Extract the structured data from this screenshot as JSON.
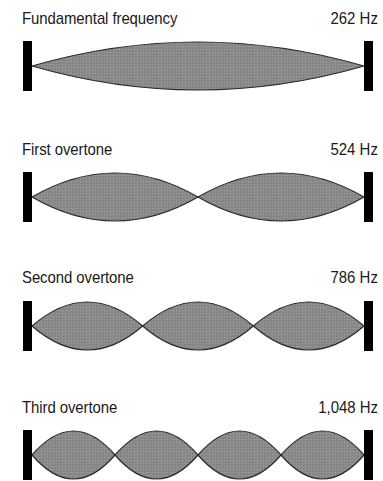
{
  "diagram": {
    "style": {
      "fill_color": "#8c8c8c",
      "outline_color": "#2b2b2b",
      "bar_color": "#000000",
      "background": "#ffffff"
    },
    "string": {
      "x_start": 32,
      "x_end": 364,
      "amplitude": 24
    },
    "rows": [
      {
        "label": "Fundamental frequency",
        "frequency": "262 Hz",
        "segments": 1,
        "center_y": 66,
        "label_top": 9
      },
      {
        "label": "First overtone",
        "frequency": "524 Hz",
        "segments": 2,
        "center_y": 197,
        "label_top": 140
      },
      {
        "label": "Second overtone",
        "frequency": "786 Hz",
        "segments": 3,
        "center_y": 326,
        "label_top": 268
      },
      {
        "label": "Third overtone",
        "frequency": "1,048 Hz",
        "segments": 4,
        "center_y": 455,
        "label_top": 398
      }
    ]
  }
}
